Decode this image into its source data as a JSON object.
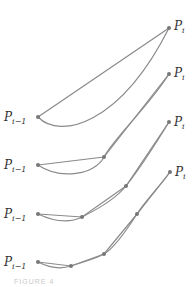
{
  "diagram": {
    "stroke_color": "#8a8a8a",
    "point_color": "#777777",
    "labels": {
      "start": {
        "base": "P",
        "sub": "i−1"
      },
      "end": {
        "base": "P",
        "sub": "i"
      }
    },
    "caption": "FIGURE 4",
    "panels": [
      {
        "name": "panel-1-chord",
        "chord_points": [
          [
            38,
            117
          ],
          [
            169,
            28
          ]
        ],
        "curve": "M38,117 C60,140 120,125 169,28",
        "start_label_pos": [
          4,
          121
        ],
        "end_label_pos": [
          174,
          30
        ]
      },
      {
        "name": "panel-2-chords",
        "chord_points": [
          [
            38,
            165
          ],
          [
            104,
            157
          ],
          [
            169,
            74
          ]
        ],
        "curve": "M38,165 C60,180 95,175 104,157 S150,105 169,74",
        "start_label_pos": [
          4,
          169
        ],
        "end_label_pos": [
          174,
          77
        ]
      },
      {
        "name": "panel-3-chords",
        "chord_points": [
          [
            38,
            214
          ],
          [
            82,
            217
          ],
          [
            126,
            186
          ],
          [
            169,
            122
          ]
        ],
        "curve": "M38,214 C55,222 70,223 82,217 S115,200 126,186 S158,140 169,122",
        "start_label_pos": [
          4,
          218
        ],
        "end_label_pos": [
          174,
          126
        ]
      },
      {
        "name": "panel-4-chords",
        "chord_points": [
          [
            38,
            262
          ],
          [
            71,
            266
          ],
          [
            104,
            254
          ],
          [
            137,
            214
          ],
          [
            170,
            172
          ]
        ],
        "curve": "M38,262 C50,268 62,269 71,266 S95,259 104,254 S128,228 137,214 S162,184 170,172",
        "start_label_pos": [
          4,
          266
        ],
        "end_label_pos": [
          175,
          176
        ]
      }
    ]
  }
}
